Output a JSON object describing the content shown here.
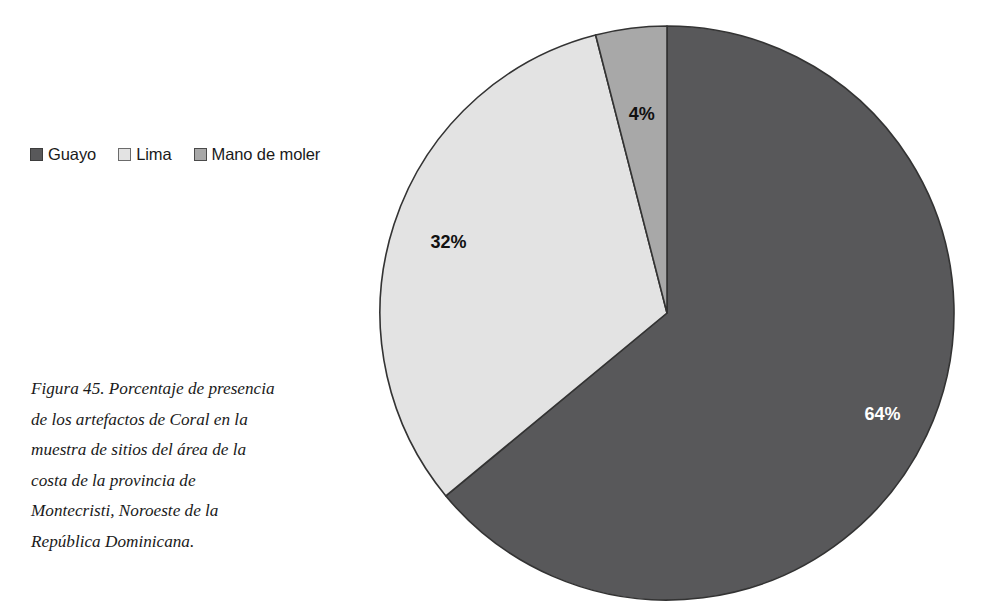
{
  "figure": {
    "caption": "Figura 45. Porcentaje de presencia de los artefactos de Coral en la muestra de sitios del área de la costa de la provincia de Montecristi, Noroeste de la República Dominicana."
  },
  "legend": {
    "items": [
      {
        "label": "Guayo",
        "color": "#58585a",
        "border": "#3d3d3d"
      },
      {
        "label": "Lima",
        "color": "#e3e3e3",
        "border": "#6b6b6b"
      },
      {
        "label": "Mano de moler",
        "color": "#a8a8a8",
        "border": "#4a4a4a"
      }
    ]
  },
  "chart_data": {
    "type": "pie",
    "title": "",
    "categories": [
      "Guayo",
      "Lima",
      "Mano de moler"
    ],
    "values": [
      64,
      32,
      4
    ],
    "unit": "%",
    "data_labels": [
      "64%",
      "32%",
      "4%"
    ],
    "colors": [
      "#58585a",
      "#e3e3e3",
      "#a8a8a8"
    ],
    "slice_border_color": "#333333",
    "start_angle_deg": 0,
    "direction": "clockwise",
    "legend_position": "left",
    "grid": false,
    "label_colors": [
      "#ffffff",
      "#111111",
      "#111111"
    ]
  }
}
